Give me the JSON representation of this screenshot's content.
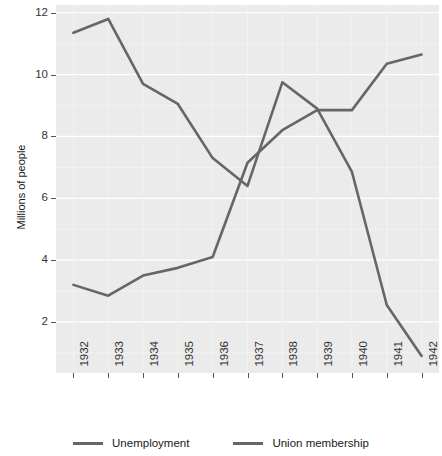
{
  "chart_data": {
    "type": "line",
    "title": "",
    "xlabel": "",
    "ylabel": "Millions of people",
    "categories": [
      "1932",
      "1933",
      "1934",
      "1935",
      "1936",
      "1937",
      "1938",
      "1939",
      "1940",
      "1941",
      "1942"
    ],
    "x": [
      1932,
      1933,
      1934,
      1935,
      1936,
      1937,
      1938,
      1939,
      1940,
      1941,
      1942
    ],
    "series": [
      {
        "name": "Unemployment",
        "color": "#666666",
        "values": [
          11.35,
          11.8,
          9.7,
          9.05,
          7.3,
          6.4,
          9.75,
          8.9,
          6.85,
          2.55,
          0.9
        ]
      },
      {
        "name": "Union membership",
        "color": "#666666",
        "values": [
          3.2,
          2.85,
          3.5,
          3.75,
          4.1,
          7.15,
          8.2,
          8.85,
          8.85,
          10.35,
          10.65
        ]
      }
    ],
    "ylim": [
      0.35,
      12.25
    ],
    "yticks": [
      2,
      4,
      6,
      8,
      10,
      12
    ],
    "ytick_labels": [
      "2",
      "4",
      "6",
      "8",
      "10",
      "12"
    ],
    "xtick_labels": [
      "1932",
      "1933",
      "1934",
      "1935",
      "1936",
      "1937",
      "1938",
      "1939",
      "1940",
      "1941",
      "1942"
    ],
    "grid": true,
    "grid_color": "#ffffff",
    "panel_color": "#ebebeb",
    "legend_position": "bottom",
    "legend_entries": [
      "Unemployment",
      "Union membership"
    ]
  }
}
